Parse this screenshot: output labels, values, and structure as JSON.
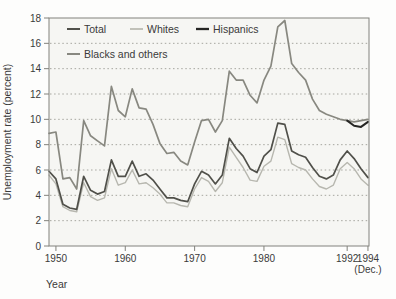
{
  "chart_data": {
    "type": "line",
    "title": "",
    "ylabel": "Unemployment rate (percent)",
    "xlabel": "Year",
    "ylim": [
      0,
      18
    ],
    "ytick_step": 2,
    "yticks": [
      0,
      2,
      4,
      6,
      8,
      10,
      12,
      14,
      16,
      18
    ],
    "grid": "horizontal-dotted",
    "legend_position": "top-left-inside",
    "x_domain": [
      1949,
      1995.15
    ],
    "xticks": [
      {
        "x_year": 1950,
        "label": "1950",
        "sublabel": ""
      },
      {
        "x_year": 1960,
        "label": "1960",
        "sublabel": ""
      },
      {
        "x_year": 1970,
        "label": "1970",
        "sublabel": ""
      },
      {
        "x_year": 1980,
        "label": "1980",
        "sublabel": ""
      },
      {
        "x_year": 1992,
        "label": "1992",
        "sublabel": ""
      },
      {
        "x_year": 1995,
        "label": "1994",
        "sublabel": "(Dec.)"
      }
    ],
    "colors": {
      "total": "#50504a",
      "whites": "#b7b7af",
      "hispanics": "#262624",
      "blacks_and_others": "#888880",
      "grid": "#9d9d96",
      "frame": "#82827c",
      "text": "#3a3a3a",
      "plot_background": "#f6f6f3"
    },
    "series": [
      {
        "name": "Total",
        "color": "#50504a",
        "width": 1.7,
        "points": [
          [
            1949,
            5.9
          ],
          [
            1950,
            5.3
          ],
          [
            1951,
            3.3
          ],
          [
            1952,
            3.0
          ],
          [
            1953,
            2.9
          ],
          [
            1954,
            5.5
          ],
          [
            1955,
            4.4
          ],
          [
            1956,
            4.1
          ],
          [
            1957,
            4.3
          ],
          [
            1958,
            6.8
          ],
          [
            1959,
            5.5
          ],
          [
            1960,
            5.5
          ],
          [
            1961,
            6.7
          ],
          [
            1962,
            5.5
          ],
          [
            1963,
            5.7
          ],
          [
            1964,
            5.2
          ],
          [
            1965,
            4.5
          ],
          [
            1966,
            3.8
          ],
          [
            1967,
            3.8
          ],
          [
            1968,
            3.6
          ],
          [
            1969,
            3.5
          ],
          [
            1970,
            4.9
          ],
          [
            1971,
            5.9
          ],
          [
            1972,
            5.6
          ],
          [
            1973,
            4.9
          ],
          [
            1974,
            5.6
          ],
          [
            1975,
            8.5
          ],
          [
            1976,
            7.7
          ],
          [
            1977,
            7.1
          ],
          [
            1978,
            6.1
          ],
          [
            1979,
            5.8
          ],
          [
            1980,
            7.1
          ],
          [
            1981,
            7.6
          ],
          [
            1982,
            9.7
          ],
          [
            1983,
            9.6
          ],
          [
            1984,
            7.5
          ],
          [
            1985,
            7.2
          ],
          [
            1986,
            7.0
          ],
          [
            1987,
            6.2
          ],
          [
            1988,
            5.5
          ],
          [
            1989,
            5.3
          ],
          [
            1990,
            5.6
          ],
          [
            1991,
            6.8
          ],
          [
            1992,
            7.5
          ],
          [
            1993,
            6.9
          ],
          [
            1994,
            6.1
          ],
          [
            1995,
            5.4
          ]
        ]
      },
      {
        "name": "Whites",
        "color": "#b7b7af",
        "width": 1.4,
        "points": [
          [
            1949,
            5.6
          ],
          [
            1950,
            4.9
          ],
          [
            1951,
            3.1
          ],
          [
            1952,
            2.8
          ],
          [
            1953,
            2.7
          ],
          [
            1954,
            5.0
          ],
          [
            1955,
            3.9
          ],
          [
            1956,
            3.6
          ],
          [
            1957,
            3.8
          ],
          [
            1958,
            6.1
          ],
          [
            1959,
            4.8
          ],
          [
            1960,
            5.0
          ],
          [
            1961,
            6.0
          ],
          [
            1962,
            4.9
          ],
          [
            1963,
            5.0
          ],
          [
            1964,
            4.6
          ],
          [
            1965,
            4.1
          ],
          [
            1966,
            3.4
          ],
          [
            1967,
            3.4
          ],
          [
            1968,
            3.2
          ],
          [
            1969,
            3.1
          ],
          [
            1970,
            4.5
          ],
          [
            1971,
            5.4
          ],
          [
            1972,
            5.1
          ],
          [
            1973,
            4.3
          ],
          [
            1974,
            5.0
          ],
          [
            1975,
            7.8
          ],
          [
            1976,
            7.0
          ],
          [
            1977,
            6.2
          ],
          [
            1978,
            5.2
          ],
          [
            1979,
            5.1
          ],
          [
            1980,
            6.3
          ],
          [
            1981,
            6.7
          ],
          [
            1982,
            8.6
          ],
          [
            1983,
            8.4
          ],
          [
            1984,
            6.5
          ],
          [
            1985,
            6.2
          ],
          [
            1986,
            6.0
          ],
          [
            1987,
            5.3
          ],
          [
            1988,
            4.7
          ],
          [
            1989,
            4.5
          ],
          [
            1990,
            4.8
          ],
          [
            1991,
            6.1
          ],
          [
            1992,
            6.6
          ],
          [
            1993,
            6.1
          ],
          [
            1994,
            5.3
          ],
          [
            1995,
            4.8
          ]
        ]
      },
      {
        "name": "Hispanics",
        "color": "#262624",
        "width": 2.0,
        "points": [
          [
            1992,
            9.9
          ],
          [
            1993,
            9.5
          ],
          [
            1994,
            9.4
          ],
          [
            1995,
            9.8
          ]
        ]
      },
      {
        "name": "Blacks and others",
        "color": "#888880",
        "width": 1.7,
        "points": [
          [
            1949,
            8.9
          ],
          [
            1950,
            9.0
          ],
          [
            1951,
            5.3
          ],
          [
            1952,
            5.4
          ],
          [
            1953,
            4.5
          ],
          [
            1954,
            9.9
          ],
          [
            1955,
            8.7
          ],
          [
            1956,
            8.3
          ],
          [
            1957,
            7.9
          ],
          [
            1958,
            12.6
          ],
          [
            1959,
            10.7
          ],
          [
            1960,
            10.2
          ],
          [
            1961,
            12.4
          ],
          [
            1962,
            10.9
          ],
          [
            1963,
            10.8
          ],
          [
            1964,
            9.6
          ],
          [
            1965,
            8.1
          ],
          [
            1966,
            7.3
          ],
          [
            1967,
            7.4
          ],
          [
            1968,
            6.7
          ],
          [
            1969,
            6.4
          ],
          [
            1970,
            8.2
          ],
          [
            1971,
            9.9
          ],
          [
            1972,
            10.0
          ],
          [
            1973,
            9.0
          ],
          [
            1974,
            9.9
          ],
          [
            1975,
            13.8
          ],
          [
            1976,
            13.1
          ],
          [
            1977,
            13.1
          ],
          [
            1978,
            11.9
          ],
          [
            1979,
            11.3
          ],
          [
            1980,
            13.1
          ],
          [
            1981,
            14.2
          ],
          [
            1982,
            17.3
          ],
          [
            1983,
            17.8
          ],
          [
            1984,
            14.4
          ],
          [
            1985,
            13.7
          ],
          [
            1986,
            13.1
          ],
          [
            1987,
            11.6
          ],
          [
            1988,
            10.7
          ],
          [
            1989,
            10.4
          ],
          [
            1990,
            10.2
          ],
          [
            1991,
            10.0
          ],
          [
            1992,
            9.9
          ],
          [
            1993,
            9.8
          ],
          [
            1994,
            9.9
          ],
          [
            1995,
            10.0
          ]
        ]
      }
    ],
    "legend_rows": [
      [
        "Total",
        "Whites",
        "Hispanics"
      ],
      [
        "Blacks and others"
      ]
    ]
  }
}
